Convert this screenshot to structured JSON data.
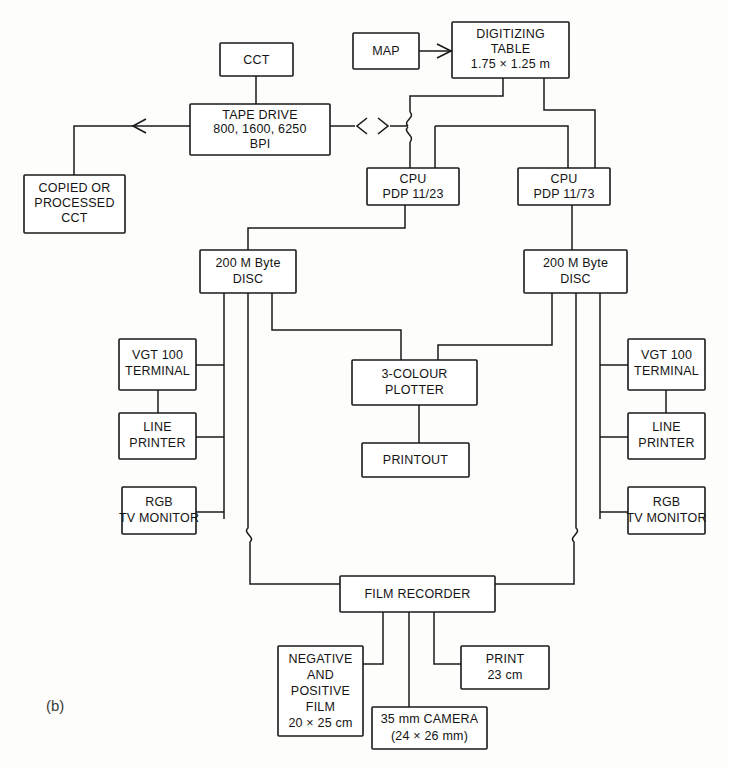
{
  "figure": {
    "label": "(b)",
    "caption_text": "(b)",
    "ink_color": "#1a1a1a",
    "paper_color": "#fdfdfc"
  },
  "nodes": [
    {
      "id": "cct",
      "lines": [
        "CCT"
      ]
    },
    {
      "id": "map",
      "lines": [
        "MAP"
      ]
    },
    {
      "id": "digitizing",
      "lines": [
        "DIGITIZING",
        "TABLE",
        "1.75  ×  1.25 m"
      ]
    },
    {
      "id": "tape-drive",
      "lines": [
        "TAPE DRIVE",
        "800, 1600, 6250",
        "BPI"
      ]
    },
    {
      "id": "copied-cct",
      "lines": [
        "COPIED OR",
        "PROCESSED",
        "CCT"
      ]
    },
    {
      "id": "cpu-left",
      "lines": [
        "CPU",
        "PDP 11/23"
      ]
    },
    {
      "id": "cpu-right",
      "lines": [
        "CPU",
        "PDP 11/73"
      ]
    },
    {
      "id": "disc-left",
      "lines": [
        "200 M Byte",
        "DISC"
      ]
    },
    {
      "id": "disc-right",
      "lines": [
        "200 M Byte",
        "DISC"
      ]
    },
    {
      "id": "vgt-left",
      "lines": [
        "VGT 100",
        "TERMINAL"
      ]
    },
    {
      "id": "vgt-right",
      "lines": [
        "VGT 100",
        "TERMINAL"
      ]
    },
    {
      "id": "printer-left",
      "lines": [
        "LINE",
        "PRINTER"
      ]
    },
    {
      "id": "printer-right",
      "lines": [
        "LINE",
        "PRINTER"
      ]
    },
    {
      "id": "rgb-left",
      "lines": [
        "RGB",
        "TV MONITOR"
      ]
    },
    {
      "id": "rgb-right",
      "lines": [
        "RGB",
        "TV MONITOR"
      ]
    },
    {
      "id": "plotter",
      "lines": [
        "3-COLOUR",
        "PLOTTER"
      ]
    },
    {
      "id": "printout",
      "lines": [
        "PRINTOUT"
      ]
    },
    {
      "id": "film-recorder",
      "lines": [
        "FILM RECORDER"
      ]
    },
    {
      "id": "film",
      "lines": [
        "NEGATIVE",
        "AND",
        "POSITIVE",
        "FILM",
        "20 × 25 cm"
      ]
    },
    {
      "id": "camera",
      "lines": [
        "35 mm CAMERA",
        "(24 × 26 mm)"
      ]
    },
    {
      "id": "print",
      "lines": [
        "PRINT",
        "23 cm"
      ]
    }
  ],
  "node_text": {
    "cct": "CCT",
    "map": "MAP",
    "digitizing_1": "DIGITIZING",
    "digitizing_2": "TABLE",
    "digitizing_3": "1.75  ×  1.25 m",
    "tape_1": "TAPE DRIVE",
    "tape_2": "800, 1600, 6250",
    "tape_3": "BPI",
    "copied_1": "COPIED OR",
    "copied_2": "PROCESSED",
    "copied_3": "CCT",
    "cpu_left_1": "CPU",
    "cpu_left_2": "PDP 11/23",
    "cpu_right_1": "CPU",
    "cpu_right_2": "PDP 11/73",
    "disc_left_1": "200 M Byte",
    "disc_left_2": "DISC",
    "disc_right_1": "200 M Byte",
    "disc_right_2": "DISC",
    "vgt_left_1": "VGT 100",
    "vgt_left_2": "TERMINAL",
    "vgt_right_1": "VGT 100",
    "vgt_right_2": "TERMINAL",
    "printer_left_1": "LINE",
    "printer_left_2": "PRINTER",
    "printer_right_1": "LINE",
    "printer_right_2": "PRINTER",
    "rgb_left_1": "RGB",
    "rgb_left_2": "TV MONITOR",
    "rgb_right_1": "RGB",
    "rgb_right_2": "TV MONITOR",
    "plotter_1": "3-COLOUR",
    "plotter_2": "PLOTTER",
    "printout_1": "PRINTOUT",
    "film_recorder_1": "FILM RECORDER",
    "film_1": "NEGATIVE",
    "film_2": "AND",
    "film_3": "POSITIVE",
    "film_4": "FILM",
    "film_5": "20 × 25 cm",
    "camera_1": "35 mm CAMERA",
    "camera_2": "(24 × 26 mm)",
    "print_1": "PRINT",
    "print_2": "23 cm"
  },
  "connections": [
    {
      "from": "cct",
      "to": "tape-drive",
      "kind": "line"
    },
    {
      "from": "map",
      "to": "digitizing",
      "kind": "arrow"
    },
    {
      "from": "tape-drive",
      "to": "copied-cct",
      "kind": "arrow"
    },
    {
      "from": "tape-drive",
      "to": "bus",
      "kind": "double-arrow"
    },
    {
      "from": "digitizing",
      "to": "cpu-left",
      "kind": "line"
    },
    {
      "from": "digitizing",
      "to": "cpu-right",
      "kind": "line"
    },
    {
      "from": "bus",
      "to": "cpu-left",
      "kind": "line"
    },
    {
      "from": "bus",
      "to": "cpu-right",
      "kind": "line"
    },
    {
      "from": "cpu-left",
      "to": "disc-left",
      "kind": "line"
    },
    {
      "from": "cpu-right",
      "to": "disc-right",
      "kind": "line"
    },
    {
      "from": "disc-left",
      "to": "vgt-left",
      "kind": "line"
    },
    {
      "from": "disc-left",
      "to": "printer-left",
      "kind": "line"
    },
    {
      "from": "disc-left",
      "to": "rgb-left",
      "kind": "line"
    },
    {
      "from": "disc-left",
      "to": "plotter",
      "kind": "line"
    },
    {
      "from": "disc-left",
      "to": "film-recorder",
      "kind": "line"
    },
    {
      "from": "disc-right",
      "to": "vgt-right",
      "kind": "line"
    },
    {
      "from": "disc-right",
      "to": "printer-right",
      "kind": "line"
    },
    {
      "from": "disc-right",
      "to": "rgb-right",
      "kind": "line"
    },
    {
      "from": "disc-right",
      "to": "plotter",
      "kind": "line"
    },
    {
      "from": "disc-right",
      "to": "film-recorder",
      "kind": "line"
    },
    {
      "from": "vgt-left",
      "to": "printer-left",
      "kind": "line"
    },
    {
      "from": "vgt-right",
      "to": "printer-right",
      "kind": "line"
    },
    {
      "from": "plotter",
      "to": "printout",
      "kind": "line"
    },
    {
      "from": "film-recorder",
      "to": "film",
      "kind": "line"
    },
    {
      "from": "film-recorder",
      "to": "camera",
      "kind": "line"
    },
    {
      "from": "film-recorder",
      "to": "print",
      "kind": "line"
    }
  ]
}
